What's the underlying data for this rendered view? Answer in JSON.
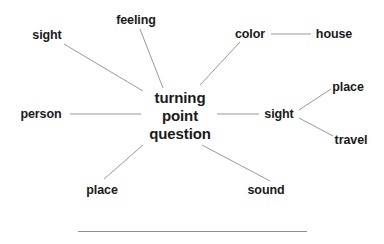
{
  "diagram": {
    "background_color": "#ffffff",
    "text_color": "#1a1a1a",
    "edge_color": "#999999",
    "rule_color": "#8f8f8f",
    "center": {
      "id": "center-node",
      "line1": "turning",
      "line2": "point",
      "line3": "question",
      "x": 180,
      "y": 116
    },
    "nodes": [
      {
        "id": "node-sight-topleft",
        "label": "sight",
        "x": 47,
        "y": 35,
        "anchor": "middle",
        "role": "leaf"
      },
      {
        "id": "node-feeling",
        "label": "feeling",
        "x": 136,
        "y": 20,
        "anchor": "middle",
        "role": "leaf"
      },
      {
        "id": "node-color",
        "label": "color",
        "x": 250,
        "y": 34,
        "anchor": "middle",
        "role": "leaf"
      },
      {
        "id": "node-house",
        "label": "house",
        "x": 334,
        "y": 34,
        "anchor": "middle",
        "role": "leaf"
      },
      {
        "id": "node-person",
        "label": "person",
        "x": 41,
        "y": 114,
        "anchor": "middle",
        "role": "leaf"
      },
      {
        "id": "node-sight-right",
        "label": "sight",
        "x": 279,
        "y": 114,
        "anchor": "middle",
        "role": "hub"
      },
      {
        "id": "node-place-right",
        "label": "place",
        "x": 348,
        "y": 87,
        "anchor": "middle",
        "role": "leaf"
      },
      {
        "id": "node-travel",
        "label": "travel",
        "x": 351,
        "y": 140,
        "anchor": "middle",
        "role": "leaf"
      },
      {
        "id": "node-place-bottom",
        "label": "place",
        "x": 102,
        "y": 190,
        "anchor": "middle",
        "role": "leaf"
      },
      {
        "id": "node-sound",
        "label": "sound",
        "x": 266,
        "y": 190,
        "anchor": "middle",
        "role": "leaf"
      }
    ],
    "edges": [
      {
        "id": "edge-sight-topleft-center",
        "from": "node-sight-topleft",
        "to": "center-node",
        "x1": 64,
        "y1": 44,
        "x2": 143,
        "y2": 91
      },
      {
        "id": "edge-feeling-center",
        "from": "node-feeling",
        "to": "center-node",
        "x1": 140,
        "y1": 29,
        "x2": 163,
        "y2": 88
      },
      {
        "id": "edge-color-center",
        "from": "node-color",
        "to": "center-node",
        "x1": 240,
        "y1": 42,
        "x2": 200,
        "y2": 85
      },
      {
        "id": "edge-color-house",
        "from": "node-color",
        "to": "node-house",
        "x1": 271,
        "y1": 34,
        "x2": 311,
        "y2": 34
      },
      {
        "id": "edge-person-center",
        "from": "node-person",
        "to": "center-node",
        "x1": 70,
        "y1": 114,
        "x2": 141,
        "y2": 114
      },
      {
        "id": "edge-center-sight-right",
        "from": "center-node",
        "to": "node-sight-right",
        "x1": 217,
        "y1": 114,
        "x2": 259,
        "y2": 114
      },
      {
        "id": "edge-sight-right-place",
        "from": "node-sight-right",
        "to": "node-place-right",
        "x1": 299,
        "y1": 110,
        "x2": 331,
        "y2": 89
      },
      {
        "id": "edge-sight-right-travel",
        "from": "node-sight-right",
        "to": "node-travel",
        "x1": 299,
        "y1": 118,
        "x2": 333,
        "y2": 136
      },
      {
        "id": "edge-place-bottom-center",
        "from": "node-place-bottom",
        "to": "center-node",
        "x1": 104,
        "y1": 179,
        "x2": 143,
        "y2": 145
      },
      {
        "id": "edge-sound-center",
        "from": "node-sound",
        "to": "center-node",
        "x1": 202,
        "y1": 145,
        "x2": 270,
        "y2": 181
      }
    ],
    "rule": {
      "id": "baseline-rule",
      "x": 78,
      "y": 231,
      "width": 229
    }
  }
}
